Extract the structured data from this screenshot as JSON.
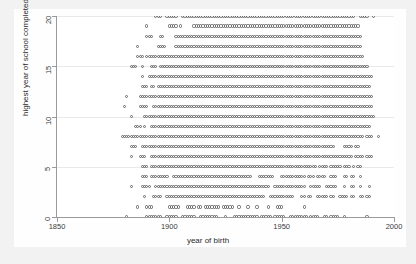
{
  "chart": {
    "type": "scatter",
    "title": "",
    "xlabel": "year of birth",
    "ylabel": "highest year of school completed",
    "xticks": [
      "1850",
      "1900",
      "1950",
      "2000"
    ],
    "yticks": [
      "0",
      "5",
      "10",
      "15",
      "20"
    ],
    "marker": "open-circle",
    "marker_color": "#666666",
    "background": "#f2f2f2",
    "plot_background": "#ffffff",
    "grid": "horizontal-faint"
  },
  "chart_data": {
    "type": "scatter",
    "title": "",
    "xlabel": "year of birth",
    "ylabel": "highest year of school completed",
    "xlim": [
      1850,
      2000
    ],
    "ylim": [
      0,
      20
    ],
    "xticks": [
      1850,
      1900,
      1950,
      2000
    ],
    "yticks": [
      0,
      5,
      10,
      15,
      20
    ],
    "grid": true,
    "legend": null,
    "marker": "open-circle",
    "series": [
      {
        "name": "respondents",
        "description": "Each open circle marks one distinct (year of birth, highest year of school completed) combination present in the data.",
        "rows": [
          {
            "y": 20,
            "segments": [
              [
                1894,
                1896
              ],
              [
                1899,
                1903
              ],
              [
                1906,
                1982
              ],
              [
                1985,
                1988
              ],
              [
                1991,
                1991
              ]
            ]
          },
          {
            "y": 19,
            "segments": [
              [
                1890,
                1890
              ],
              [
                1900,
                1903
              ],
              [
                1905,
                1905
              ],
              [
                1911,
                1984
              ]
            ]
          },
          {
            "y": 18,
            "segments": [
              [
                1890,
                1892
              ],
              [
                1896,
                1897
              ],
              [
                1903,
                1985
              ]
            ]
          },
          {
            "y": 17,
            "segments": [
              [
                1886,
                1886
              ],
              [
                1895,
                1898
              ],
              [
                1903,
                1985
              ]
            ]
          },
          {
            "y": 16,
            "segments": [
              [
                1886,
                1888
              ],
              [
                1890,
                1986
              ]
            ]
          },
          {
            "y": 15,
            "segments": [
              [
                1883,
                1885
              ],
              [
                1888,
                1888
              ],
              [
                1892,
                1894
              ],
              [
                1896,
                1988
              ]
            ]
          },
          {
            "y": 14,
            "segments": [
              [
                1888,
                1888
              ],
              [
                1891,
                1990
              ]
            ]
          },
          {
            "y": 13,
            "segments": [
              [
                1888,
                1890
              ],
              [
                1892,
                1893
              ],
              [
                1895,
                1989
              ]
            ]
          },
          {
            "y": 12,
            "segments": [
              [
                1881,
                1881
              ],
              [
                1887,
                1990
              ]
            ]
          },
          {
            "y": 11,
            "segments": [
              [
                1880,
                1880
              ],
              [
                1887,
                1890
              ],
              [
                1893,
                1990
              ]
            ]
          },
          {
            "y": 10,
            "segments": [
              [
                1883,
                1883
              ],
              [
                1889,
                1991
              ]
            ]
          },
          {
            "y": 9,
            "segments": [
              [
                1885,
                1887
              ],
              [
                1889,
                1889
              ],
              [
                1892,
                1989
              ]
            ]
          },
          {
            "y": 8,
            "segments": [
              [
                1879,
                1986
              ],
              [
                1988,
                1990
              ],
              [
                1993,
                1993
              ]
            ]
          },
          {
            "y": 7,
            "segments": [
              [
                1883,
                1885
              ],
              [
                1888,
                1973
              ],
              [
                1978,
                1981
              ],
              [
                1983,
                1984
              ]
            ]
          },
          {
            "y": 6,
            "segments": [
              [
                1883,
                1883
              ],
              [
                1887,
                1889
              ],
              [
                1892,
                1981
              ],
              [
                1983,
                1986
              ],
              [
                1988,
                1990
              ]
            ]
          },
          {
            "y": 5,
            "segments": [
              [
                1888,
                1890
              ],
              [
                1892,
                1965
              ],
              [
                1967,
                1970
              ],
              [
                1972,
                1976
              ],
              [
                1978,
                1980
              ],
              [
                1982,
                1982
              ],
              [
                1984,
                1985
              ]
            ]
          },
          {
            "y": 4,
            "segments": [
              [
                1888,
                1890
              ],
              [
                1892,
                1899
              ],
              [
                1902,
                1936
              ],
              [
                1940,
                1946
              ],
              [
                1950,
                1960
              ],
              [
                1962,
                1964
              ],
              [
                1966,
                1969
              ],
              [
                1972,
                1974
              ],
              [
                1978,
                1979
              ],
              [
                1981,
                1982
              ],
              [
                1985,
                1985
              ]
            ]
          },
          {
            "y": 3,
            "segments": [
              [
                1883,
                1883
              ],
              [
                1888,
                1891
              ],
              [
                1894,
                1944
              ],
              [
                1947,
                1960
              ],
              [
                1963,
                1967
              ],
              [
                1970,
                1974
              ],
              [
                1978,
                1978
              ],
              [
                1981,
                1982
              ],
              [
                1985,
                1985
              ],
              [
                1989,
                1989
              ]
            ]
          },
          {
            "y": 2,
            "segments": [
              [
                1889,
                1889
              ],
              [
                1893,
                1896
              ],
              [
                1899,
                1942
              ],
              [
                1945,
                1955
              ],
              [
                1959,
                1960
              ],
              [
                1962,
                1963
              ],
              [
                1966,
                1970
              ],
              [
                1972,
                1973
              ],
              [
                1976,
                1979
              ],
              [
                1981,
                1982
              ],
              [
                1985,
                1986
              ],
              [
                1988,
                1989
              ]
            ]
          },
          {
            "y": 1,
            "segments": [
              [
                1886,
                1886
              ],
              [
                1890,
                1892
              ],
              [
                1900,
                1904
              ],
              [
                1908,
                1911
              ],
              [
                1913,
                1914
              ],
              [
                1916,
                1922
              ],
              [
                1924,
                1928
              ],
              [
                1931,
                1931
              ],
              [
                1935,
                1935
              ],
              [
                1939,
                1939
              ],
              [
                1944,
                1944
              ],
              [
                1948,
                1950
              ],
              [
                1960,
                1960
              ]
            ]
          },
          {
            "y": 0,
            "segments": [
              [
                1881,
                1881
              ],
              [
                1890,
                1896
              ],
              [
                1899,
                1903
              ],
              [
                1906,
                1911
              ],
              [
                1914,
                1921
              ],
              [
                1925,
                1925
              ],
              [
                1929,
                1939
              ],
              [
                1941,
                1945
              ],
              [
                1947,
                1951
              ],
              [
                1954,
                1961
              ],
              [
                1963,
                1966
              ],
              [
                1969,
                1970
              ],
              [
                1972,
                1975
              ],
              [
                1978,
                1978
              ],
              [
                1988,
                1988
              ]
            ]
          }
        ]
      }
    ]
  }
}
